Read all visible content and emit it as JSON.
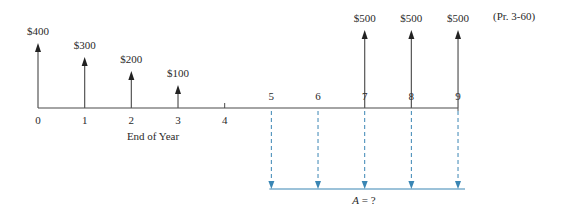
{
  "problem_ref": "(Pr. 3-60)",
  "axis_label": "End of Year",
  "unknown_label_var": "A",
  "unknown_label_rest": " = ?",
  "colors": {
    "axis": "#4a4a4a",
    "arrow": "#4a4a4a",
    "annuity": "#3a86b4"
  },
  "chart_data": {
    "type": "cash-flow-diagram",
    "title": "",
    "xlabel": "End of Year",
    "x": [
      0,
      1,
      2,
      3,
      4,
      5,
      6,
      7,
      8,
      9
    ],
    "tick_labels": [
      "0",
      "1",
      "2",
      "3",
      "4",
      "5",
      "6",
      "7",
      "8",
      "9"
    ],
    "inflows": [
      {
        "year": 0,
        "amount": 400,
        "label": "$400"
      },
      {
        "year": 1,
        "amount": 300,
        "label": "$300"
      },
      {
        "year": 2,
        "amount": 200,
        "label": "$200"
      },
      {
        "year": 3,
        "amount": 100,
        "label": "$100"
      },
      {
        "year": 7,
        "amount": 500,
        "label": "$500"
      },
      {
        "year": 8,
        "amount": 500,
        "label": "$500"
      },
      {
        "year": 9,
        "amount": 500,
        "label": "$500"
      }
    ],
    "outflows": {
      "years": [
        5,
        6,
        7,
        8,
        9
      ],
      "label": "A = ?",
      "style": "dashed",
      "color": "#3a86b4"
    },
    "annotation": "(Pr. 3-60)"
  }
}
